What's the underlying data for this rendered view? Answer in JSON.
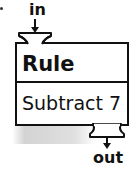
{
  "diagram": {
    "type": "function-machine",
    "input_label": "in",
    "output_label": "out",
    "rule_title": "Rule",
    "rule_text": "Subtract 7",
    "stroke_color": "#111111",
    "shadow_color": "#bdbdbd"
  }
}
